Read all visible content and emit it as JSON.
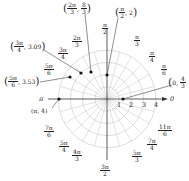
{
  "chart_data": {
    "type": "scatter",
    "title": "",
    "coordinate_system": "polar",
    "grid": {
      "circles": [
        1,
        2,
        3,
        4
      ],
      "spokes_every": "π/12",
      "radial_axis_labels": [
        "1",
        "2",
        "3",
        "4"
      ]
    },
    "angle_labels": [
      {
        "num": "π",
        "den": "2",
        "id": "pi-over-2"
      },
      {
        "num": "π",
        "den": "3",
        "id": "pi-over-3"
      },
      {
        "num": "π",
        "den": "4",
        "id": "pi-over-4"
      },
      {
        "num": "π",
        "den": "6",
        "id": "pi-over-6"
      },
      {
        "num": "0",
        "den": "",
        "id": "zero"
      },
      {
        "num": "2π",
        "den": "3",
        "id": "2pi-over-3"
      },
      {
        "num": "3π",
        "den": "4",
        "id": "3pi-over-4"
      },
      {
        "num": "5π",
        "den": "6",
        "id": "5pi-over-6"
      },
      {
        "num": "π",
        "den": "",
        "id": "pi"
      },
      {
        "num": "7π",
        "den": "6",
        "id": "7pi-over-6"
      },
      {
        "num": "5π",
        "den": "4",
        "id": "5pi-over-4"
      },
      {
        "num": "4π",
        "den": "3",
        "id": "4pi-over-3"
      },
      {
        "num": "3π",
        "den": "2",
        "id": "3pi-over-2"
      },
      {
        "num": "5π",
        "den": "3",
        "id": "5pi-over-3"
      },
      {
        "num": "7π",
        "den": "4",
        "id": "7pi-over-4"
      },
      {
        "num": "11π",
        "den": "6",
        "id": "11pi-over-6"
      }
    ],
    "points": [
      {
        "label": "(2π/3, 8/3)",
        "theta": "2π/3",
        "r": 2.667
      },
      {
        "label": "(π/2, 2)",
        "theta": "π/2",
        "r": 2
      },
      {
        "label": "(3π/4, 3.09)",
        "theta": "3π/4",
        "r": 3.09
      },
      {
        "label": "(5π/6, 3.53)",
        "theta": "5π/6",
        "r": 3.53
      },
      {
        "label": "(π, 4)",
        "theta": "π",
        "r": 4
      },
      {
        "label": "(0, 4/3)",
        "theta": "0",
        "r": 1.333
      }
    ]
  },
  "labels": {
    "pi_over_2": {
      "num": "π",
      "den": "2"
    },
    "pi_over_3": {
      "num": "π",
      "den": "3"
    },
    "pi_over_4": {
      "num": "π",
      "den": "4"
    },
    "pi_over_6": {
      "num": "π",
      "den": "6"
    },
    "zero": "0",
    "two_pi_over_3": {
      "num": "2π",
      "den": "3"
    },
    "three_pi_over_4": {
      "num": "3π",
      "den": "4"
    },
    "five_pi_over_6": {
      "num": "5π",
      "den": "6"
    },
    "pi": "π",
    "seven_pi_over_6": {
      "num": "7π",
      "den": "6"
    },
    "five_pi_over_4": {
      "num": "5π",
      "den": "4"
    },
    "four_pi_over_3": {
      "num": "4π",
      "den": "3"
    },
    "three_pi_over_2": {
      "num": "3π",
      "den": "2"
    },
    "five_pi_over_3": {
      "num": "5π",
      "den": "3"
    },
    "seven_pi_over_4": {
      "num": "7π",
      "den": "4"
    },
    "eleven_pi_over_6": {
      "num": "11π",
      "den": "6"
    },
    "r1": "1",
    "r2": "2",
    "r3": "3",
    "r4": "4"
  },
  "point_labels": {
    "p1": {
      "a_num": "2π",
      "a_den": "3",
      "r_num": "8",
      "r_den": "3"
    },
    "p2": {
      "a_num": "π",
      "a_den": "2",
      "r": "2"
    },
    "p3": {
      "a_num": "3π",
      "a_den": "4",
      "r": "3.09"
    },
    "p4": {
      "a_num": "5π",
      "a_den": "6",
      "r": "3.53"
    },
    "p5": {
      "text": "(π, 4)"
    },
    "p6": {
      "a": "0",
      "r_num": "4",
      "r_den": "3"
    }
  },
  "colors": {
    "grid": "#c8c8c8",
    "axis": "#333333",
    "point": "#111111",
    "leader": "#444444"
  }
}
